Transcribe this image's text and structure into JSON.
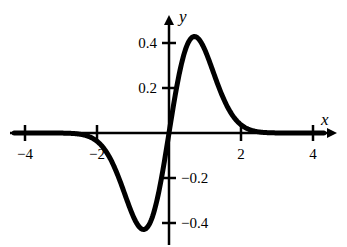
{
  "chart_data": {
    "type": "line",
    "title": "",
    "xlabel": "x",
    "ylabel": "y",
    "xlim": [
      -4.4,
      4.4
    ],
    "ylim": [
      -0.45,
      0.48
    ],
    "grid": false,
    "legend": null,
    "x_ticks": [
      -4,
      -2,
      2,
      4
    ],
    "x_tick_labels": [
      "−4",
      "−2",
      "2",
      "4"
    ],
    "y_ticks": [
      0.4,
      0.2,
      -0.2,
      -0.4
    ],
    "y_tick_labels": [
      "0.4",
      "0.2",
      "−0.2",
      "−0.4"
    ],
    "series": [
      {
        "name": "y = x e^(-x^2)",
        "x": [
          -4,
          -3,
          -2,
          -1.5,
          -1,
          -0.707,
          -0.5,
          0,
          0.5,
          0.707,
          1,
          1.5,
          2,
          3,
          4
        ],
        "values": [
          0.0,
          0.0,
          -0.037,
          -0.158,
          -0.368,
          -0.429,
          -0.389,
          0.0,
          0.389,
          0.429,
          0.368,
          0.158,
          0.037,
          0.0,
          0.0
        ]
      }
    ],
    "color": "#000000"
  }
}
